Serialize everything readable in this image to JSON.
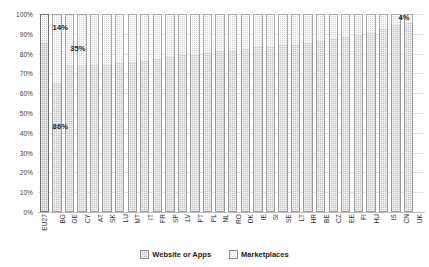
{
  "chart_data": {
    "type": "bar",
    "stacked": true,
    "stack_mode": "percent",
    "title": "",
    "xlabel": "",
    "ylabel": "",
    "ylim": [
      0,
      100
    ],
    "ytick_labels": [
      "100%",
      "90%",
      "80%",
      "70%",
      "60%",
      "50%",
      "40%",
      "30%",
      "20%",
      "10%",
      "0%"
    ],
    "ytick_values": [
      100,
      90,
      80,
      70,
      60,
      50,
      40,
      30,
      20,
      10,
      0
    ],
    "grid": true,
    "legend_position": "bottom",
    "legend": [
      "Website or Apps",
      "Marketplaces"
    ],
    "categories": [
      "EU27",
      "BG",
      "GE",
      "CY",
      "AT",
      "SK",
      "LU",
      "MT",
      "IT",
      "FR",
      "SP",
      "LV",
      "PT",
      "PL",
      "NL",
      "RO",
      "DK",
      "IE",
      "SI",
      "SE",
      "LT",
      "HR",
      "BE",
      "CZ",
      "EE",
      "FI",
      "HU",
      "IS",
      "CN",
      "UK"
    ],
    "series": [
      {
        "name": "Website or Apps",
        "values": [
          86,
          65,
          74,
          74,
          75,
          75,
          76,
          76,
          77,
          78,
          79,
          80,
          80,
          81,
          82,
          82,
          83,
          84,
          84,
          85,
          85,
          86,
          87,
          88,
          89,
          90,
          91,
          93,
          95,
          96
        ]
      },
      {
        "name": "Marketplaces",
        "values": [
          14,
          35,
          26,
          26,
          25,
          25,
          24,
          24,
          23,
          22,
          21,
          20,
          20,
          19,
          18,
          18,
          17,
          16,
          16,
          15,
          15,
          14,
          13,
          12,
          11,
          10,
          9,
          7,
          5,
          4
        ]
      }
    ],
    "annotations": [
      {
        "text": "14%",
        "category": "EU27",
        "series": "Marketplaces"
      },
      {
        "text": "35%",
        "category": "BG",
        "series": "Marketplaces"
      },
      {
        "text": "86%",
        "category": "EU27",
        "series": "Website or Apps"
      },
      {
        "text": "4%",
        "category": "UK",
        "series": "Marketplaces"
      }
    ],
    "group_breaks": [
      1,
      27
    ],
    "colors": {
      "website_or_apps": "#c3c3c3",
      "marketplaces": "#d5d5d5",
      "gridline": "#e3e3e3",
      "axis": "#bdbdbd",
      "text": "#1a1a1a"
    }
  },
  "legend": {
    "items": [
      {
        "label": "Website or Apps",
        "swatch": "web"
      },
      {
        "label": "Marketplaces",
        "swatch": "market"
      }
    ]
  }
}
